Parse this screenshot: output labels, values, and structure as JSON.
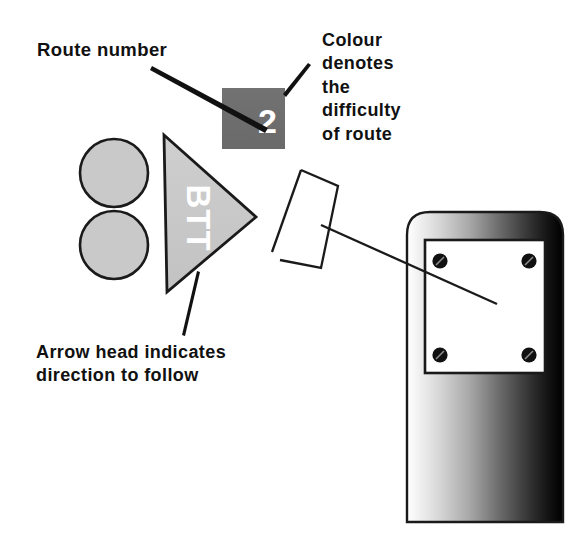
{
  "figure": {
    "background_color": "#ffffff"
  },
  "annotations": {
    "route_number": {
      "label": "Route number",
      "target": "route-number-tile"
    },
    "colour_difficulty": {
      "label": "Colour\ndenotes\nthe\ndifficulty\nof route",
      "target": "route-number-tile"
    },
    "arrow_head": {
      "label": "Arrow head indicates\ndirection to follow",
      "target": "direction-arrow"
    }
  },
  "sign": {
    "route_number_value": "2",
    "route_number_tile_color": "#6e6e6e",
    "route_number_text_color": "#ffffff",
    "arrow_text": "BTT",
    "arrow_fill_color": "#c9c9c9",
    "arrow_text_color": "#ffffff",
    "disc_fill_color": "#c9c9c9",
    "disc_outline_color": "#1a1a1a",
    "discs": [
      {
        "name": "upper-disc"
      },
      {
        "name": "lower-disc"
      }
    ]
  },
  "plate_outline": {
    "name": "sign-plate-outline",
    "stroke_color": "#1a1a1a"
  },
  "post": {
    "name": "waymarker-post",
    "outline_color": "#1a1a1a",
    "gradient_light": "#f2f2f2",
    "gradient_dark": "#000000",
    "plate_color": "#ffffff",
    "screw_color": "#111111",
    "screws": [
      {
        "name": "screw-top-left"
      },
      {
        "name": "screw-top-right"
      },
      {
        "name": "screw-bottom-left"
      },
      {
        "name": "screw-bottom-right"
      }
    ]
  },
  "leader_lines": [
    {
      "name": "leader-route-number",
      "color": "#111111"
    },
    {
      "name": "leader-colour-difficulty",
      "color": "#111111"
    },
    {
      "name": "leader-arrow-head",
      "color": "#111111"
    },
    {
      "name": "leader-plate-to-post",
      "color": "#1a1a1a"
    }
  ]
}
